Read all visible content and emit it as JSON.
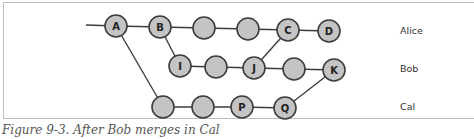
{
  "figure": {
    "caption": "Figure 9-3. After Bob merges in Cal"
  },
  "branches": [
    {
      "name": "Alice",
      "x": 400,
      "y": 32
    },
    {
      "name": "Bob",
      "x": 400,
      "y": 70
    },
    {
      "name": "Cal",
      "x": 400,
      "y": 108
    }
  ],
  "nodes": [
    {
      "id": "A",
      "label": "A",
      "x": 116,
      "y": 26
    },
    {
      "id": "B",
      "label": "B",
      "x": 160,
      "y": 27
    },
    {
      "id": "a1",
      "label": "",
      "x": 204,
      "y": 28
    },
    {
      "id": "a2",
      "label": "",
      "x": 248,
      "y": 29
    },
    {
      "id": "C",
      "label": "C",
      "x": 288,
      "y": 30
    },
    {
      "id": "D",
      "label": "D",
      "x": 329,
      "y": 31
    },
    {
      "id": "I",
      "label": "I",
      "x": 180,
      "y": 66
    },
    {
      "id": "b1",
      "label": "",
      "x": 216,
      "y": 67
    },
    {
      "id": "J",
      "label": "J",
      "x": 254,
      "y": 68
    },
    {
      "id": "b2",
      "label": "",
      "x": 294,
      "y": 69
    },
    {
      "id": "K",
      "label": "K",
      "x": 334,
      "y": 70
    },
    {
      "id": "c1",
      "label": "",
      "x": 163,
      "y": 107
    },
    {
      "id": "c2",
      "label": "",
      "x": 203,
      "y": 107
    },
    {
      "id": "P",
      "label": "P",
      "x": 242,
      "y": 107
    },
    {
      "id": "Q",
      "label": "Q",
      "x": 285,
      "y": 108
    }
  ],
  "edges": [
    [
      "start",
      "A"
    ],
    [
      "A",
      "B"
    ],
    [
      "B",
      "a1"
    ],
    [
      "a1",
      "a2"
    ],
    [
      "a2",
      "C"
    ],
    [
      "C",
      "D"
    ],
    [
      "B",
      "I"
    ],
    [
      "I",
      "b1"
    ],
    [
      "b1",
      "J"
    ],
    [
      "J",
      "b2"
    ],
    [
      "b2",
      "K"
    ],
    [
      "C",
      "J"
    ],
    [
      "A",
      "c1"
    ],
    [
      "c1",
      "c2"
    ],
    [
      "c2",
      "P"
    ],
    [
      "P",
      "Q"
    ],
    [
      "Q",
      "K"
    ]
  ],
  "start_point": {
    "x": 86,
    "y": 25
  },
  "style": {
    "node_fill": "#c4c4c4",
    "stroke": "#3d3d3d",
    "node_radius": 11
  }
}
